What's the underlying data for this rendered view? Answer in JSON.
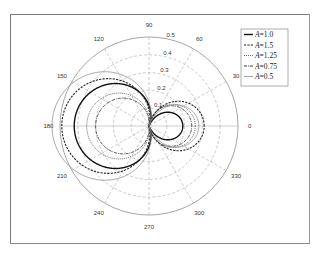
{
  "chart_data": {
    "type": "polar-line",
    "title": "",
    "angle_ticks": [
      "0",
      "30",
      "60",
      "90",
      "120",
      "150",
      "180",
      "210",
      "240",
      "270",
      "300",
      "330"
    ],
    "angle_values_deg": [
      0,
      30,
      60,
      90,
      120,
      150,
      180,
      210,
      240,
      270,
      300,
      330
    ],
    "radial_ticks": [
      "0.1",
      "0.2",
      "0.3",
      "0.4",
      "0.5"
    ],
    "radial_values": [
      0.1,
      0.2,
      0.3,
      0.4,
      0.5
    ],
    "rlim": [
      0,
      0.5
    ],
    "grid": true,
    "legend_position": "upper right",
    "series": [
      {
        "name": "A=1.0",
        "label_var": "A",
        "label_val": "=1.0",
        "style": "solid",
        "color": "#111111",
        "width": 1.4,
        "left_lobe_max": 0.42,
        "right_lobe_max": 0.19
      },
      {
        "name": "A=1.5",
        "label_var": "A",
        "label_val": "=1.5",
        "style": "dashed",
        "color": "#222222",
        "width": 1.1,
        "left_lobe_max": 0.49,
        "right_lobe_max": 0.31
      },
      {
        "name": "A=1.25",
        "label_var": "A",
        "label_val": "=1.25",
        "style": "dotted",
        "color": "#444444",
        "width": 0.9,
        "left_lobe_max": 0.35,
        "right_lobe_max": 0.26
      },
      {
        "name": "A=0.75",
        "label_var": "A",
        "label_val": "=0.75",
        "style": "dashdot",
        "color": "#333333",
        "width": 1.0,
        "left_lobe_max": 0.3,
        "right_lobe_max": 0.24
      },
      {
        "name": "A=0.5",
        "label_var": "A",
        "label_val": "=0.5",
        "style": "solid",
        "color": "#8a8a8a",
        "width": 0.8,
        "left_lobe_max": 0.545,
        "right_lobe_max": 0.28
      }
    ],
    "model_note": "r(theta) = |(L-R)/2 - (L+R)/2 * cos(theta)|"
  },
  "colors": {
    "grid_dashed": "#a8a8a8",
    "grid_axis": "#b0b0b0",
    "outer_circle": "#8f8f8f",
    "frame": "#7a7a7a",
    "legend_border": "#8a8a8a"
  }
}
